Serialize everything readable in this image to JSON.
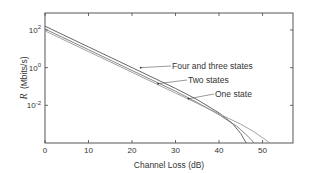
{
  "chart_data": {
    "type": "line",
    "title": "",
    "xlabel": "Channel Loss (dB)",
    "ylabel": "R (Mbits/s)",
    "ylabel_italic_symbol": "R",
    "ylabel_unit": "(Mbits/s)",
    "xscale": "linear",
    "yscale": "log",
    "xlim": [
      0,
      57
    ],
    "ylim_log10": [
      -4.0,
      2.9
    ],
    "xticks": [
      0,
      10,
      20,
      30,
      40,
      50
    ],
    "xtick_labels": [
      "0",
      "10",
      "20",
      "30",
      "40",
      "50"
    ],
    "yticks_log10": [
      2,
      0,
      -2
    ],
    "ytick_labels": [
      {
        "base": "10",
        "exp": "2"
      },
      {
        "base": "10",
        "exp": "0"
      },
      {
        "base": "10",
        "exp": "-2"
      }
    ],
    "grid": false,
    "legend": "annotations",
    "series": [
      {
        "name": "Four and three states",
        "color": "#555555",
        "x": [
          0,
          10,
          20,
          30,
          35,
          40,
          43,
          45,
          46,
          46.3
        ],
        "log10_y": [
          2.2,
          1.1,
          0.0,
          -1.1,
          -1.7,
          -2.4,
          -2.95,
          -3.5,
          -3.9,
          -4.0
        ]
      },
      {
        "name": "Two states",
        "color": "#777777",
        "x": [
          0,
          10,
          20,
          30,
          35,
          40,
          44,
          46,
          47.5,
          48
        ],
        "log10_y": [
          2.05,
          0.95,
          -0.15,
          -1.25,
          -1.85,
          -2.5,
          -3.1,
          -3.5,
          -3.85,
          -4.0
        ]
      },
      {
        "name": "One state",
        "color": "#999999",
        "x": [
          0,
          10,
          20,
          30,
          35,
          40,
          45,
          48,
          50.5,
          51.7
        ],
        "log10_y": [
          1.95,
          0.85,
          -0.25,
          -1.35,
          -1.9,
          -2.45,
          -3.0,
          -3.4,
          -3.8,
          -4.0
        ]
      }
    ],
    "annotations": [
      {
        "text": "Four and three states",
        "text_x_px": 172,
        "text_y_px": 69,
        "arrow_to_x": 22,
        "arrow_to_log10y": 0.0
      },
      {
        "text": "Two states",
        "text_x_px": 188,
        "text_y_px": 83,
        "arrow_to_x": 26,
        "arrow_to_log10y": -0.85
      },
      {
        "text": "One state",
        "text_x_px": 215,
        "text_y_px": 97,
        "arrow_to_x": 33,
        "arrow_to_log10y": -1.65
      }
    ]
  }
}
